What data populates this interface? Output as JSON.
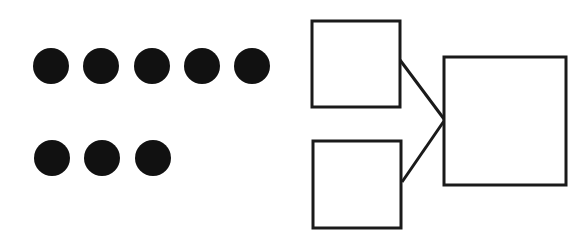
{
  "diagram": {
    "dots": {
      "color": "#111111",
      "radius": 18,
      "rows": [
        {
          "count": 5,
          "y": 66,
          "x": [
            51,
            101,
            152,
            202,
            252
          ]
        },
        {
          "count": 3,
          "y": 158,
          "x": [
            52,
            102,
            153
          ]
        }
      ]
    },
    "boxes": [
      {
        "id": "top-addend-box",
        "x": 312,
        "y": 21,
        "w": 88,
        "h": 86
      },
      {
        "id": "bottom-addend-box",
        "x": 313,
        "y": 141,
        "w": 88,
        "h": 87
      },
      {
        "id": "sum-box",
        "x": 444,
        "y": 57,
        "w": 122,
        "h": 128
      }
    ],
    "connectors": [
      {
        "from": "top-addend-box",
        "x1": 400,
        "y1": 60,
        "x2": 444,
        "y2": 119
      },
      {
        "from": "bottom-addend-box",
        "x1": 402,
        "y1": 182,
        "x2": 444,
        "y2": 121
      }
    ],
    "stroke_color": "#1a1a1a"
  }
}
